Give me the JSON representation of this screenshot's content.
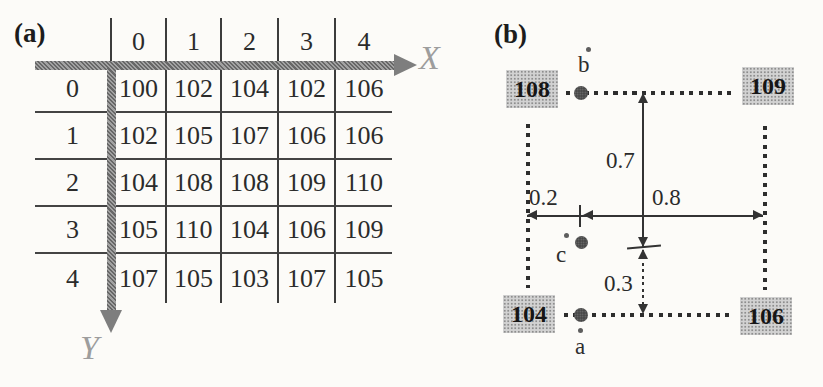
{
  "panel_a": {
    "label": "(a)",
    "x_axis_label": "X",
    "y_axis_label": "Y",
    "col_headers": [
      "0",
      "1",
      "2",
      "3",
      "4"
    ],
    "rows": [
      {
        "label": "0",
        "values": [
          "100",
          "102",
          "104",
          "102",
          "106"
        ]
      },
      {
        "label": "1",
        "values": [
          "102",
          "105",
          "107",
          "106",
          "106"
        ]
      },
      {
        "label": "2",
        "values": [
          "104",
          "108",
          "108",
          "109",
          "110"
        ]
      },
      {
        "label": "3",
        "values": [
          "105",
          "110",
          "104",
          "106",
          "109"
        ]
      },
      {
        "label": "4",
        "values": [
          "107",
          "105",
          "103",
          "107",
          "105"
        ]
      }
    ]
  },
  "panel_b": {
    "label": "(b)",
    "corner_values": {
      "top_left": "108",
      "top_right": "109",
      "bottom_left": "104",
      "bottom_right": "106"
    },
    "point_labels": {
      "a": "a",
      "b": "b",
      "c": "c"
    },
    "distances": {
      "upper_vertical": "0.7",
      "lower_vertical": "0.3",
      "left_horizontal": "0.2",
      "right_horizontal": "0.8"
    }
  },
  "colors": {
    "background": "#fcfbf8",
    "table_line": "#3c3c3c",
    "axis_arrow_gray": "#7e7e7e",
    "axis_letter_gray": "#9d9d9d",
    "corner_box_bg": "#d2d2d2",
    "dot_dark": "#2d2d2d",
    "text": "#2b2b2b"
  }
}
